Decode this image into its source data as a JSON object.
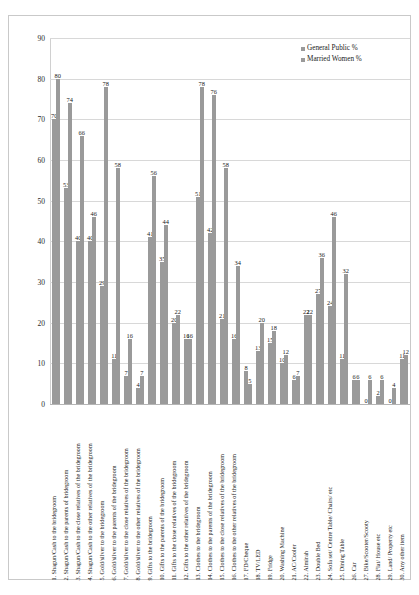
{
  "legend": {
    "position": "top-right",
    "entries": [
      "General Public  %",
      "Married Women  %"
    ]
  },
  "axis": {
    "yticks": [
      "0",
      "10",
      "20",
      "30",
      "40",
      "50",
      "60",
      "70",
      "80",
      "90"
    ]
  },
  "chart_data": {
    "type": "bar",
    "title": "",
    "xlabel": "",
    "ylabel": "",
    "ylim": [
      0,
      90
    ],
    "grid": true,
    "legend_position": "top-right",
    "categories": [
      "1.   Shagun/Cash to the bridegroom",
      "2.   Shagun/Cash to the parents of bridegroom",
      "3.   Shagun/Cash to the close relatives of the bridegroom",
      "4.   Shagun/Cash to the other relatives of the bridegroom",
      "5.   Gold/silver  to the bridegroom",
      "6.   Gold/silver  to the parents of the bridegroom",
      "7.   Gold/silver to the close relatives of the bridegroom",
      "8.   Gold/silver to the other relatives of the bridegroom",
      "9.   Gifts to the bridegroom",
      "10.  Gifts to the parents of the bridegroom",
      "11.  Gifts to the close relatives of the bridegroom",
      "12.  Gifts to the other relatives of the bridegroom",
      "13.  Clothes to the bridegroom",
      "14.  Clothes to the parents of the bridegroom",
      "15.  Clothes to the close relatives of the bridegroom",
      "16.  Clothes to the other relatives of the bridegroom",
      "17.  FD/Cheque",
      "18.  TV/LED",
      "19.  Fridge",
      "20.  Washing Machine",
      "21.  AC/Cooler",
      "22.  Almirah",
      "23.  Double Bed",
      "24.  Sofa set/ Centre Table/ Chairs/ etc",
      "25.  Dining Table",
      "26.  Car",
      "27.  Bike/Scooter/Scooty",
      "28.  Flat/ House etc",
      "29.  Land/ Property etc",
      "30.  Any other item"
    ],
    "series": [
      {
        "name": "General Public  %",
        "color": "#9a9a9a",
        "values": [
          70,
          53,
          40,
          40,
          29,
          11,
          7,
          4,
          41,
          35,
          20,
          16,
          51,
          42,
          21,
          16,
          8,
          13,
          15,
          10,
          6,
          22,
          27,
          24,
          11,
          6,
          0,
          2,
          0,
          11
        ]
      },
      {
        "name": "Married Women  %",
        "color": "#9a9a9a",
        "values": [
          80,
          74,
          66,
          46,
          78,
          58,
          16,
          7,
          56,
          44,
          22,
          16,
          78,
          76,
          58,
          34,
          5,
          20,
          18,
          12,
          7,
          22,
          36,
          46,
          32,
          6,
          6,
          6,
          4,
          12
        ]
      }
    ]
  }
}
